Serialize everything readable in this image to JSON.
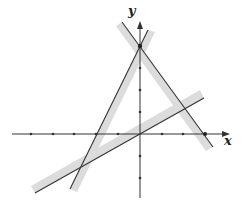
{
  "diagram": {
    "type": "system-of-linear-inequalities-graph",
    "axes": {
      "x_label": "x",
      "y_label": "y",
      "x_ticks": [
        -5,
        -4,
        -3,
        -2,
        -1,
        1,
        2,
        3
      ],
      "y_ticks": [
        -3,
        -2,
        -1,
        1,
        2,
        3,
        4
      ]
    },
    "lines": [
      {
        "id": "line-1",
        "equation": "y = 2x + 4",
        "shaded_side": "right"
      },
      {
        "id": "line-2",
        "equation": "y = -4/3 x + 4",
        "shaded_side": "left"
      },
      {
        "id": "line-3",
        "equation": "y = x/2",
        "shaded_side": "above"
      }
    ],
    "marked_points": [
      {
        "label": "y-intercept",
        "x": 0,
        "y": 4
      },
      {
        "label": "x-intercept",
        "x": 3,
        "y": 0
      }
    ],
    "colors": {
      "line": "#333333",
      "shading": "#d6d6d6",
      "axis": "#333333"
    }
  }
}
